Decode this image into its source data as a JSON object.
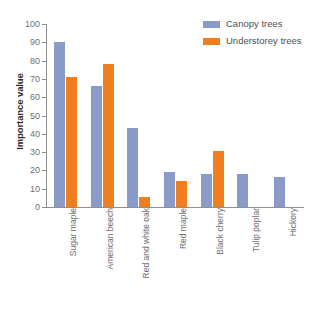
{
  "chart_data": {
    "type": "bar",
    "title": "",
    "xlabel": "",
    "ylabel": "Importance value",
    "ylim": [
      0,
      100
    ],
    "ytick_step": 10,
    "yticks": [
      0,
      10,
      20,
      30,
      40,
      50,
      60,
      70,
      80,
      90,
      100
    ],
    "ytick_labels": [
      "0",
      "10",
      "20",
      "30",
      "40",
      "50",
      "60",
      "70",
      "80",
      "90",
      "100"
    ],
    "grid": false,
    "legend_position": "top-right",
    "categories": [
      "Sugar maple",
      "American beech",
      "Red and white oak",
      "Red maple",
      "Black cherry",
      "Tulip poplar",
      "Hickory"
    ],
    "series": [
      {
        "name": "Canopy trees",
        "color": "#8b9bc8",
        "values": [
          90,
          66,
          43,
          19,
          18,
          18,
          16.5
        ]
      },
      {
        "name": "Understorey trees",
        "color": "#f07d1e",
        "values": [
          71,
          78,
          5.5,
          14,
          30.5,
          0,
          0
        ]
      }
    ]
  },
  "legend": {
    "items": [
      {
        "label": "Canopy trees",
        "color": "#8b9bc8"
      },
      {
        "label": "Understorey trees",
        "color": "#f07d1e"
      }
    ]
  },
  "axes": {
    "y_title": "Importance value"
  },
  "colors": {
    "canopy": "#8b9bc8",
    "understorey": "#f07d1e",
    "axis": "#8d8f91",
    "tick_text": "#6d6e70",
    "title_text": "#2b2b2b",
    "background": "#ffffff"
  }
}
